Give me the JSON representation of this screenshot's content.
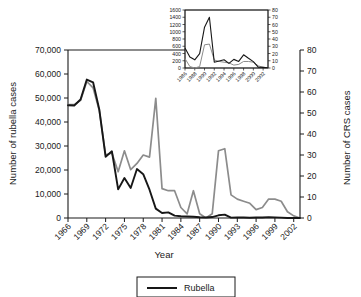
{
  "figure": {
    "background_color": "#ffffff",
    "rubella_color": "#171717",
    "crs_color": "#8c8c8c"
  },
  "chart_data": {
    "type": "line",
    "title": "",
    "xlabel": "Year",
    "ylabel": "Number of rubella cases",
    "y2label": "Number of CRS cases",
    "grid": false,
    "legend_position": "bottom",
    "xlim": [
      1966,
      2003
    ],
    "ylim": [
      0,
      70000
    ],
    "y2lim": [
      0,
      80
    ],
    "xticks": [
      "1966",
      "1969",
      "1972",
      "1975",
      "1978",
      "1981",
      "1984",
      "1987",
      "1990",
      "1993",
      "1996",
      "1999",
      "2002"
    ],
    "yticks": [
      "0",
      "10,000",
      "20,000",
      "30,000",
      "40,000",
      "50,000",
      "60,000",
      "70,000"
    ],
    "y2ticks": [
      "0",
      "10",
      "20",
      "30",
      "40",
      "50",
      "60",
      "70",
      "80"
    ],
    "x": [
      1966,
      1967,
      1968,
      1969,
      1970,
      1971,
      1972,
      1973,
      1974,
      1975,
      1976,
      1977,
      1978,
      1979,
      1980,
      1981,
      1982,
      1983,
      1984,
      1985,
      1986,
      1987,
      1988,
      1989,
      1990,
      1991,
      1992,
      1993,
      1994,
      1995,
      1996,
      1997,
      1998,
      1999,
      2000,
      2001,
      2002,
      2003
    ],
    "series": [
      {
        "name": "Rubella",
        "axis": "left",
        "color": "#171717",
        "values": [
          46975,
          46888,
          49371,
          57686,
          56552,
          45086,
          25507,
          27804,
          11917,
          16652,
          12491,
          20395,
          18269,
          11795,
          3904,
          2077,
          2325,
          970,
          752,
          630,
          551,
          306,
          225,
          396,
          1125,
          1401,
          160,
          192,
          227,
          128,
          238,
          181,
          364,
          267,
          176,
          23,
          18,
          7
        ]
      },
      {
        "name": "CRS",
        "axis": "right",
        "color": "#8c8c8c",
        "values": [
          54,
          54,
          56,
          65,
          62,
          51,
          30,
          31,
          22,
          32,
          23,
          26,
          30,
          29,
          57,
          14,
          13,
          13,
          5,
          2,
          13,
          2,
          0,
          2,
          32,
          33,
          11,
          9,
          8,
          7,
          4,
          5,
          9,
          9,
          8,
          3,
          1,
          0
        ]
      }
    ],
    "legend": [
      {
        "label": "Rubella",
        "color": "#171717"
      }
    ],
    "inset": {
      "type": "line",
      "xlim": [
        1986,
        2003
      ],
      "ylim": [
        0,
        1600
      ],
      "y2lim": [
        0,
        80
      ],
      "xticks": [
        "1986",
        "1988",
        "1990",
        "1992",
        "1994",
        "1996",
        "1998",
        "2000",
        "2002"
      ],
      "yticks": [
        "0",
        "200",
        "400",
        "600",
        "800",
        "1000",
        "1200",
        "1400",
        "1600"
      ],
      "y2ticks": [
        "0",
        "10",
        "20",
        "30",
        "40",
        "50",
        "60",
        "70",
        "80"
      ],
      "x": [
        1986,
        1987,
        1988,
        1989,
        1990,
        1991,
        1992,
        1993,
        1994,
        1995,
        1996,
        1997,
        1998,
        1999,
        2000,
        2001,
        2002,
        2003
      ],
      "series": [
        {
          "name": "Rubella",
          "axis": "left",
          "color": "#171717",
          "values": [
            551,
            306,
            225,
            396,
            1125,
            1401,
            160,
            192,
            227,
            128,
            238,
            181,
            364,
            267,
            176,
            23,
            18,
            7
          ]
        },
        {
          "name": "CRS",
          "axis": "right",
          "color": "#8c8c8c",
          "values": [
            13,
            2,
            0,
            2,
            32,
            33,
            11,
            9,
            8,
            7,
            4,
            5,
            9,
            9,
            8,
            3,
            1,
            0
          ]
        }
      ]
    }
  }
}
